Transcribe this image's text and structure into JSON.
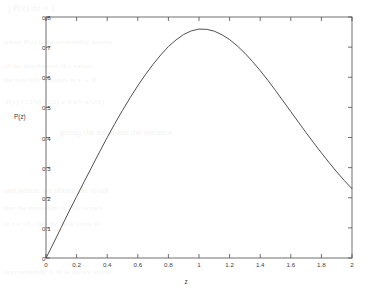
{
  "figure": {
    "background_color": "#ffffff",
    "axis_color": "#4d4d4d",
    "curve_color": "#3b3b3b"
  },
  "background_text": {
    "lines": [
      "∫ P(z) dz  =  1",
      "where  P(z)  is the probability density",
      "of the distribution of z values",
      "the function vanishes as z → 0",
      "P(z) = (2/π)^(1/2) z^2 e^(-z^2/2)",
      "giving the mean and the variance",
      "and hence, we obtain the result",
      "that the maximum of P(z) occurs",
      "at z = √2 , and the peak value is",
      "approximately 0.76 as shown above"
    ]
  },
  "chart_data": {
    "type": "line",
    "title": "",
    "xlabel": "z",
    "ylabel": "P(z)",
    "xlim": [
      0,
      2
    ],
    "ylim": [
      0,
      0.8
    ],
    "grid": false,
    "legend": null,
    "xticks": [
      "0",
      "0.2",
      "0.4",
      "0.6",
      "0.8",
      "1",
      "1.2",
      "1.4",
      "1.6",
      "1.8",
      "2"
    ],
    "xtick_values": [
      0,
      0.2,
      0.4,
      0.6,
      0.8,
      1,
      1.2,
      1.4,
      1.6,
      1.8,
      2
    ],
    "yticks": [
      "0",
      "0.1",
      "0.2",
      "0.3",
      "0.4",
      "0.5",
      "0.6",
      "0.7",
      "0.8"
    ],
    "ytick_values": [
      0,
      0.1,
      0.2,
      0.3,
      0.4,
      0.5,
      0.6,
      0.7,
      0.8
    ],
    "series": [
      {
        "name": "P(z)",
        "color": "#3b3b3b",
        "x": [
          0,
          0.05,
          0.1,
          0.15,
          0.2,
          0.25,
          0.3,
          0.35,
          0.4,
          0.45,
          0.5,
          0.55,
          0.6,
          0.65,
          0.7,
          0.75,
          0.8,
          0.85,
          0.9,
          0.95,
          1.0,
          1.05,
          1.1,
          1.15,
          1.2,
          1.25,
          1.3,
          1.35,
          1.4,
          1.45,
          1.5,
          1.55,
          1.6,
          1.65,
          1.7,
          1.75,
          1.8,
          1.85,
          1.9,
          1.95,
          2.0
        ],
        "y": [
          0.0,
          0.05,
          0.102,
          0.154,
          0.204,
          0.254,
          0.303,
          0.352,
          0.4,
          0.446,
          0.49,
          0.532,
          0.572,
          0.609,
          0.643,
          0.674,
          0.702,
          0.724,
          0.742,
          0.754,
          0.76,
          0.759,
          0.753,
          0.741,
          0.725,
          0.704,
          0.68,
          0.652,
          0.622,
          0.59,
          0.556,
          0.521,
          0.486,
          0.451,
          0.416,
          0.382,
          0.349,
          0.317,
          0.286,
          0.257,
          0.23
        ],
        "peak": {
          "x": 0.82,
          "y": 0.76
        }
      }
    ]
  }
}
